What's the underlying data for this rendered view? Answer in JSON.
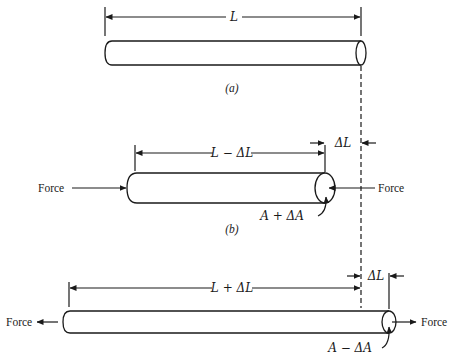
{
  "diagram": {
    "reference_line": "dashed vertical line marking original rod end",
    "panels": [
      {
        "id": "a",
        "caption": "(a)",
        "dimension_label": "L",
        "state": "unloaded"
      },
      {
        "id": "b",
        "caption": "(b)",
        "dimension_label": "L − ΔL",
        "delta_label": "ΔL",
        "area_label": "A + ΔA",
        "force_left": "Force",
        "force_right": "Force",
        "state": "compression"
      },
      {
        "id": "c",
        "dimension_label": "L + ΔL",
        "delta_label": "ΔL",
        "area_label": "A − ΔA",
        "force_left": "Force",
        "force_right": "Force",
        "state": "tension"
      }
    ]
  }
}
